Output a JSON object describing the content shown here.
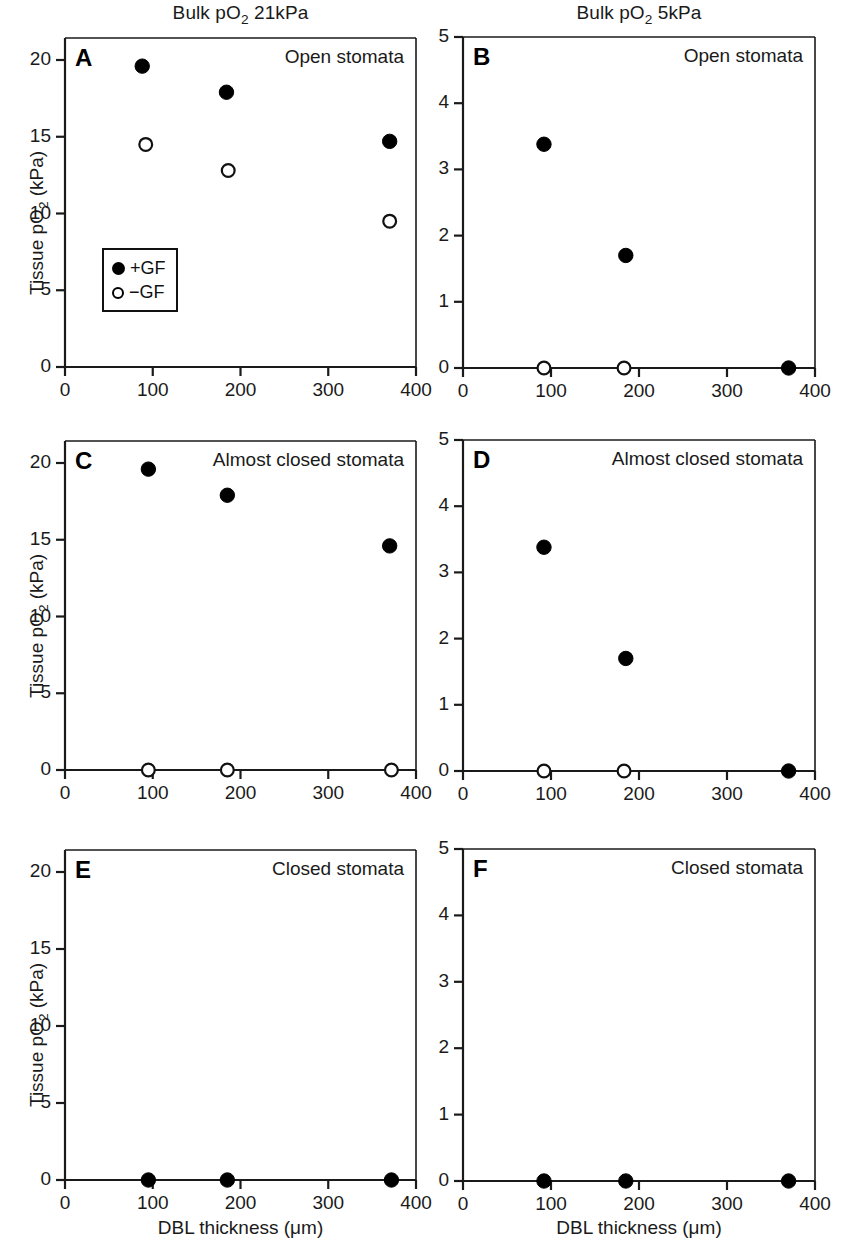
{
  "figure": {
    "column_titles": [
      {
        "text": "Bulk pO2 21kPa",
        "pre": "Bulk pO",
        "sub": "2",
        "post": " 21kPa"
      },
      {
        "text": "Bulk pO2 5kPa",
        "pre": "Bulk pO",
        "sub": "2",
        "post": " 5kPa"
      }
    ],
    "x_axis_label": {
      "pre": "DBL thickness (",
      "mu": "μ",
      "post": "m)"
    },
    "y_axis_label": {
      "pre": "Tissue pO",
      "sub": "2",
      "post": " (kPa)"
    },
    "legend": {
      "entries": [
        {
          "marker": "filled-circle",
          "label": "+GF"
        },
        {
          "marker": "open-circle",
          "label": "−GF"
        }
      ]
    }
  },
  "chart_data": [
    {
      "type": "scatter",
      "panel": "A",
      "title": "Bulk pO2 21kPa",
      "caption": "Open stomata",
      "xlabel": "DBL thickness (μm)",
      "ylabel": "Tissue pO2 (kPa)",
      "xlim": [
        0,
        400
      ],
      "ylim": [
        0,
        20
      ],
      "xticks": [
        0,
        100,
        200,
        300,
        400
      ],
      "yticks": [
        0,
        5,
        10,
        15,
        20
      ],
      "grid": false,
      "series": [
        {
          "name": "+GF",
          "marker": "filled-circle",
          "x": [
            88,
            184,
            370
          ],
          "y": [
            19.6,
            17.9,
            14.7
          ]
        },
        {
          "name": "−GF",
          "marker": "open-circle",
          "x": [
            92,
            186,
            370
          ],
          "y": [
            14.5,
            12.8,
            9.5
          ]
        }
      ]
    },
    {
      "type": "scatter",
      "panel": "B",
      "title": "Bulk pO2 5kPa",
      "caption": "Open stomata",
      "xlabel": "DBL thickness (μm)",
      "ylabel": "Tissue pO2 (kPa)",
      "xlim": [
        0,
        400
      ],
      "ylim": [
        0,
        5
      ],
      "xticks": [
        0,
        100,
        200,
        300,
        400
      ],
      "yticks": [
        0,
        1,
        2,
        3,
        4,
        5
      ],
      "grid": false,
      "series": [
        {
          "name": "+GF",
          "marker": "filled-circle",
          "x": [
            92,
            185,
            370
          ],
          "y": [
            3.38,
            1.7,
            0.0
          ]
        },
        {
          "name": "−GF",
          "marker": "open-circle",
          "x": [
            92,
            183,
            null
          ],
          "y": [
            0.0,
            0.0,
            null
          ]
        }
      ]
    },
    {
      "type": "scatter",
      "panel": "C",
      "title": "Bulk pO2 21kPa",
      "caption": "Almost closed stomata",
      "xlabel": "DBL thickness (μm)",
      "ylabel": "Tissue pO2 (kPa)",
      "xlim": [
        0,
        400
      ],
      "ylim": [
        0,
        20
      ],
      "xticks": [
        0,
        100,
        200,
        300,
        400
      ],
      "yticks": [
        0,
        5,
        10,
        15,
        20
      ],
      "grid": false,
      "series": [
        {
          "name": "+GF",
          "marker": "filled-circle",
          "x": [
            95,
            185,
            370
          ],
          "y": [
            19.6,
            17.9,
            14.6
          ]
        },
        {
          "name": "−GF",
          "marker": "open-circle",
          "x": [
            95,
            185,
            372
          ],
          "y": [
            0.0,
            0.0,
            0.0
          ]
        }
      ]
    },
    {
      "type": "scatter",
      "panel": "D",
      "title": "Bulk pO2 5kPa",
      "caption": "Almost closed stomata",
      "xlabel": "DBL thickness (μm)",
      "ylabel": "Tissue pO2 (kPa)",
      "xlim": [
        0,
        400
      ],
      "ylim": [
        0,
        5
      ],
      "xticks": [
        0,
        100,
        200,
        300,
        400
      ],
      "yticks": [
        0,
        1,
        2,
        3,
        4,
        5
      ],
      "grid": false,
      "series": [
        {
          "name": "+GF",
          "marker": "filled-circle",
          "x": [
            92,
            185,
            370
          ],
          "y": [
            3.38,
            1.7,
            0.0
          ]
        },
        {
          "name": "−GF",
          "marker": "open-circle",
          "x": [
            92,
            183,
            null
          ],
          "y": [
            0.0,
            0.0,
            null
          ]
        }
      ]
    },
    {
      "type": "scatter",
      "panel": "E",
      "title": "Bulk pO2 21kPa",
      "caption": "Closed stomata",
      "xlabel": "DBL thickness (μm)",
      "ylabel": "Tissue pO2 (kPa)",
      "xlim": [
        0,
        400
      ],
      "ylim": [
        0,
        20
      ],
      "xticks": [
        0,
        100,
        200,
        300,
        400
      ],
      "yticks": [
        0,
        5,
        10,
        15,
        20
      ],
      "grid": false,
      "series": [
        {
          "name": "+GF",
          "marker": "filled-circle",
          "x": [
            95,
            185,
            372
          ],
          "y": [
            0.0,
            0.0,
            0.0
          ]
        }
      ]
    },
    {
      "type": "scatter",
      "panel": "F",
      "title": "Bulk pO2 5kPa",
      "caption": "Closed stomata",
      "xlabel": "DBL thickness (μm)",
      "ylabel": "Tissue pO2 (kPa)",
      "xlim": [
        0,
        400
      ],
      "ylim": [
        0,
        5
      ],
      "xticks": [
        0,
        100,
        200,
        300,
        400
      ],
      "yticks": [
        0,
        1,
        2,
        3,
        4,
        5
      ],
      "grid": false,
      "series": [
        {
          "name": "+GF",
          "marker": "filled-circle",
          "x": [
            92,
            185,
            370
          ],
          "y": [
            0.0,
            0.0,
            0.0
          ]
        }
      ]
    }
  ]
}
